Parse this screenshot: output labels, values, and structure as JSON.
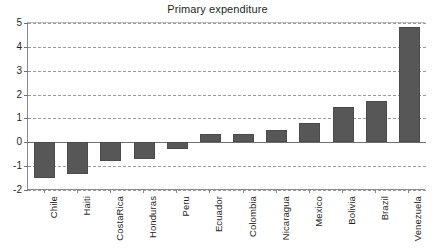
{
  "chart_data": {
    "type": "bar",
    "title": "Primary expenditure",
    "xlabel": "",
    "ylabel": "",
    "ylim": [
      -2,
      5
    ],
    "yticks": [
      -2,
      -1,
      0,
      1,
      2,
      3,
      4,
      5
    ],
    "ytick_labels": [
      "-2",
      "-1",
      "0",
      "1",
      "2",
      "3",
      "4",
      "5"
    ],
    "grid": true,
    "grid_style": "dashed-horizontal",
    "legend": "none",
    "bar_color": "#575757",
    "categories": [
      "Chile",
      "Haiti",
      "CostaRica",
      "Honduras",
      "Peru",
      "Ecuador",
      "Colombia",
      "Nicaragua",
      "Mexico",
      "Bolivia",
      "Brazil",
      "Venezuela"
    ],
    "values": [
      -1.5,
      -1.33,
      -0.77,
      -0.72,
      -0.3,
      0.33,
      0.35,
      0.5,
      0.8,
      1.5,
      1.75,
      4.85
    ]
  }
}
